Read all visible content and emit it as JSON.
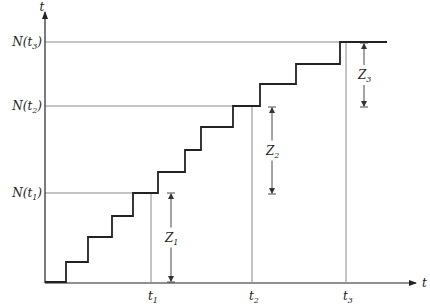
{
  "axes": {
    "x_label": "t",
    "y_label": "t",
    "x_ticks": [
      {
        "label": "t",
        "sub": "1",
        "x": 151
      },
      {
        "label": "t",
        "sub": "2",
        "x": 252
      },
      {
        "label": "t",
        "sub": "3",
        "x": 346
      }
    ],
    "y_levels": [
      {
        "label": "N(t",
        "sub": "1",
        "tail": ")",
        "y": 193
      },
      {
        "label": "N(t",
        "sub": "2",
        "tail": ")",
        "y": 106
      },
      {
        "label": "N(t",
        "sub": "3",
        "tail": ")",
        "y": 42
      }
    ]
  },
  "dimensions": [
    {
      "label": "Z",
      "sub": "1",
      "x": 171,
      "y1": 193,
      "y2": 282
    },
    {
      "label": "Z",
      "sub": "2",
      "x": 272,
      "y1": 107,
      "y2": 194
    },
    {
      "label": "Z",
      "sub": "3",
      "x": 364,
      "y1": 43,
      "y2": 107
    }
  ],
  "staircase": {
    "description": "Counting process N(t) step function",
    "points": [
      [
        45,
        282
      ],
      [
        66,
        282
      ],
      [
        66,
        262
      ],
      [
        88,
        262
      ],
      [
        88,
        237
      ],
      [
        112,
        237
      ],
      [
        112,
        216
      ],
      [
        133,
        216
      ],
      [
        133,
        193
      ],
      [
        158,
        193
      ],
      [
        158,
        172
      ],
      [
        185,
        172
      ],
      [
        185,
        150
      ],
      [
        201,
        150
      ],
      [
        201,
        127
      ],
      [
        233,
        127
      ],
      [
        233,
        106
      ],
      [
        260,
        106
      ],
      [
        260,
        84
      ],
      [
        296,
        84
      ],
      [
        296,
        64
      ],
      [
        340,
        64
      ],
      [
        340,
        42
      ],
      [
        387,
        42
      ]
    ]
  }
}
